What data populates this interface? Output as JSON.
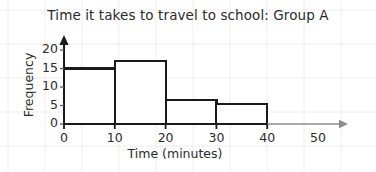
{
  "chart_data": {
    "type": "bar",
    "title": "Time it takes to travel to school: Group A",
    "xlabel": "Time (minutes)",
    "ylabel": "Frequency",
    "categories": [
      "0-10",
      "10-20",
      "20-30",
      "30-40"
    ],
    "bin_edges": [
      0,
      10,
      20,
      30,
      40
    ],
    "values": [
      15,
      17,
      6.5,
      5.5
    ],
    "xlim": [
      0,
      50
    ],
    "ylim": [
      0,
      21
    ],
    "xticks": [
      0,
      10,
      20,
      30,
      40,
      50
    ],
    "yticks": [
      0,
      5,
      10,
      15,
      20
    ],
    "xtick_labels": [
      "0",
      "10",
      "20",
      "30",
      "40",
      "50"
    ],
    "ytick_labels": [
      "0",
      "5",
      "10",
      "15",
      "20"
    ],
    "grid": "faint-background-only",
    "legend": "none",
    "bar_fill": "#ffffff",
    "bar_edge": "#1a1a1a",
    "axis_color": "#1a1a1a",
    "axis_extension_color": "#8c8c8c",
    "text_color": "#2b2b2b",
    "grid_color": "#f0eeea"
  }
}
